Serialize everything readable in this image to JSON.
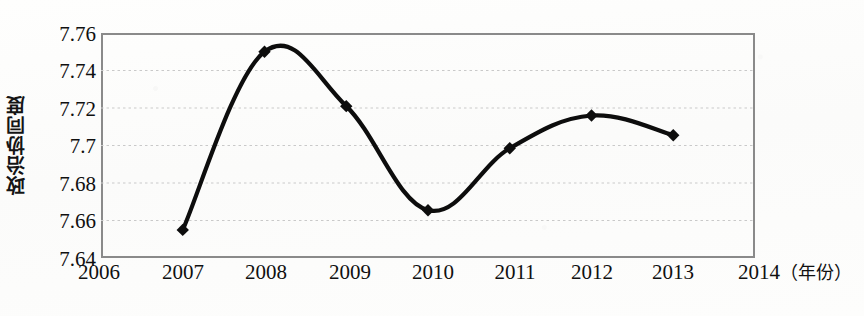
{
  "chart_data": {
    "type": "line",
    "title": "",
    "xlabel": "年份",
    "ylabel": "政治协同度",
    "x": [
      2006,
      2007,
      2008,
      2009,
      2010,
      2011,
      2012,
      2013,
      2014
    ],
    "xtick_labels": [
      "2006",
      "2007",
      "2008",
      "2009",
      "2010",
      "2011",
      "2012",
      "2013",
      "2014"
    ],
    "x_unit_label": "（年份）",
    "xlim": [
      2006,
      2014
    ],
    "ylim": [
      7.64,
      7.76
    ],
    "ytick_labels": [
      "7.76",
      "7.74",
      "7.72",
      "7.7",
      "7.68",
      "7.66",
      "7.64"
    ],
    "yticks": [
      7.76,
      7.74,
      7.72,
      7.7,
      7.68,
      7.66,
      7.64
    ],
    "grid": true,
    "grid_style": "dotted-horizontal",
    "legend": null,
    "legend_position": "none",
    "marker": "diamond",
    "line_color": "#0d0d0d",
    "grid_color": "#c9c9c9",
    "frame_color": "#8a8a8a",
    "background_color": "#fdfdfc",
    "series": [
      {
        "name": "政治协同度",
        "x": [
          2007,
          2008,
          2009,
          2010,
          2011,
          2012,
          2013
        ],
        "values": [
          7.655,
          7.75,
          7.721,
          7.6655,
          7.6985,
          7.716,
          7.7055
        ]
      }
    ]
  }
}
